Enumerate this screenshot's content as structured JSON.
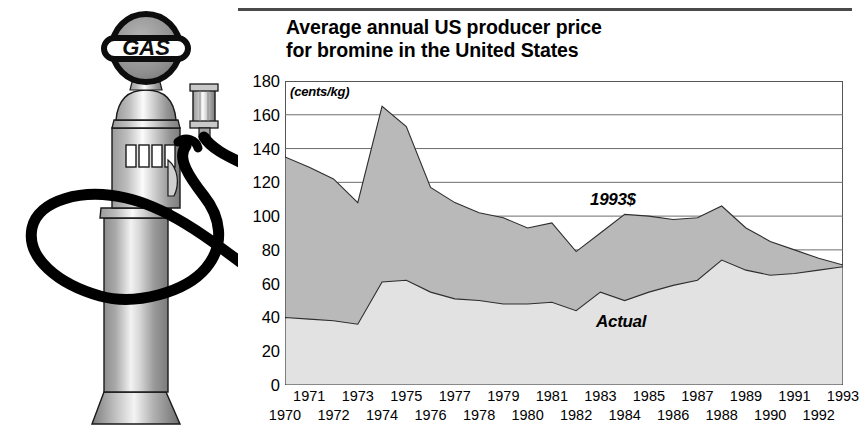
{
  "illustration": {
    "alt_name": "vintage-gas-pump",
    "globe_text": "GAS",
    "parts": [
      "globe-sign",
      "pump-body",
      "display-windows",
      "nozzle",
      "hose",
      "base"
    ]
  },
  "chart_data": {
    "type": "area",
    "title": "Average annual US producer price for bromine in the United States",
    "title_lines": [
      "Average annual US producer price",
      "for bromine in the United States"
    ],
    "units_label": "(cents/kg)",
    "xlabel": "",
    "ylabel": "",
    "ylim": [
      0,
      180
    ],
    "yticks": [
      0,
      20,
      40,
      60,
      80,
      100,
      120,
      140,
      160,
      180
    ],
    "grid": true,
    "grid_orientation": "horizontal",
    "legend_position": "inline-annotation",
    "x": [
      1970,
      1971,
      1972,
      1973,
      1974,
      1975,
      1976,
      1977,
      1978,
      1979,
      1980,
      1981,
      1982,
      1983,
      1984,
      1985,
      1986,
      1987,
      1988,
      1989,
      1990,
      1991,
      1992,
      1993
    ],
    "xticks_top_row": [
      1971,
      1973,
      1975,
      1977,
      1979,
      1981,
      1983,
      1985,
      1987,
      1989,
      1991,
      1993
    ],
    "xticks_bottom_row": [
      1970,
      1972,
      1974,
      1976,
      1978,
      1980,
      1982,
      1984,
      1986,
      1988,
      1990,
      1992
    ],
    "series": [
      {
        "name": "1993$",
        "fill_color": "#b9b9b9",
        "values": [
          135,
          129,
          122,
          108,
          165,
          153,
          117,
          108,
          102,
          99,
          93,
          96,
          79,
          90,
          101,
          100,
          98,
          99,
          106,
          93,
          85,
          80,
          75,
          71
        ]
      },
      {
        "name": "Actual",
        "fill_color": "#e2e2e2",
        "values": [
          40,
          39,
          38,
          36,
          61,
          62,
          55,
          51,
          50,
          48,
          48,
          49,
          44,
          55,
          50,
          55,
          59,
          62,
          74,
          68,
          65,
          66,
          68,
          70
        ]
      }
    ],
    "annotations": [
      {
        "text": "1993$",
        "x": 1974.6,
        "y": 108
      },
      {
        "text": "Actual",
        "x": 1974.8,
        "y": 30
      }
    ]
  },
  "colors": {
    "upper_band": "#b9b9b9",
    "lower_band": "#e2e2e2",
    "frame": "#555555",
    "grid": "#6d6d6d",
    "rule": "#4a4a4a",
    "text": "#000000"
  }
}
